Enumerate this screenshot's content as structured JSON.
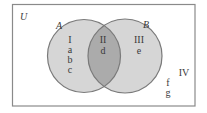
{
  "diagram": {
    "type": "venn",
    "universe_label": "U",
    "sets": [
      {
        "name": "A"
      },
      {
        "name": "B"
      }
    ],
    "regions": [
      {
        "id": "I",
        "description": "A only",
        "elements": [
          "a",
          "b",
          "c"
        ]
      },
      {
        "id": "II",
        "description": "A and B",
        "elements": [
          "d"
        ]
      },
      {
        "id": "III",
        "description": "B only",
        "elements": [
          "e"
        ]
      },
      {
        "id": "IV",
        "description": "neither A nor B",
        "elements": [
          "f",
          "g"
        ]
      }
    ],
    "colors": {
      "background": "#ffffff",
      "universe_border": "#8a8a8a",
      "circle_fill": "#d6d6d6",
      "intersection_fill": "#ababab",
      "circle_stroke": "#7a7a7a",
      "text": "#3a3a3a"
    }
  },
  "labels": {
    "U": "U",
    "A": "A",
    "B": "B",
    "region_I": "I",
    "region_II": "II",
    "region_III": "III",
    "region_IV": "IV",
    "elem_a": "a",
    "elem_b": "b",
    "elem_c": "c",
    "elem_d": "d",
    "elem_e": "e",
    "elem_f": "f",
    "elem_g": "g"
  }
}
